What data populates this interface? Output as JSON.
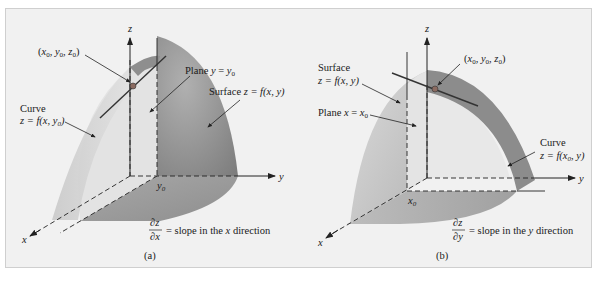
{
  "figure": {
    "panels": [
      {
        "id": "a",
        "caption": "(a)",
        "axes": {
          "x": "x",
          "y": "y",
          "z": "z"
        },
        "point_label": "(x0, y0, z0)",
        "point_label_parts": {
          "open": "(",
          "x": "x",
          "x_sub": "0",
          "y": "y",
          "y_sub": "0",
          "z": "z",
          "z_sub": "0",
          "close": ")"
        },
        "plane_label": {
          "prefix": "Plane ",
          "var": "y",
          "eq": " = ",
          "val": "y",
          "sub": "0"
        },
        "surface_label": {
          "prefix": "Surface ",
          "text": "z = f(x, y)"
        },
        "curve_label": {
          "title": "Curve",
          "text": "z = f(x, y",
          "sub": "0",
          "close": ")"
        },
        "axis_tick_label": {
          "var": "y",
          "sub": "0"
        },
        "derivative": {
          "num": "∂z",
          "den": "∂x",
          "text": "= slope in the ",
          "dir_var": "x",
          "suffix": " direction"
        }
      },
      {
        "id": "b",
        "caption": "(b)",
        "axes": {
          "x": "x",
          "y": "y",
          "z": "z"
        },
        "point_label": "(x0, y0, z0)",
        "point_label_parts": {
          "open": "(",
          "x": "x",
          "x_sub": "0",
          "y": "y",
          "y_sub": "0",
          "z": "z",
          "z_sub": "0",
          "close": ")"
        },
        "plane_label": {
          "prefix": "Plane ",
          "var": "x",
          "eq": " = ",
          "val": "x",
          "sub": "0"
        },
        "surface_label": {
          "title": "Surface",
          "text": "z = f(x, y)"
        },
        "curve_label": {
          "title": "Curve",
          "text": "z = f(x",
          "sub": "0",
          "close": ", y)"
        },
        "axis_tick_label": {
          "var": "x",
          "sub": "0"
        },
        "derivative": {
          "num": "∂z",
          "den": "∂y",
          "text": "= slope in the ",
          "dir_var": "y",
          "suffix": " direction"
        }
      }
    ],
    "colors": {
      "background": "#f1f1f1",
      "border": "#cfcfcf",
      "surface_dark": "#8a8a8a",
      "surface_light": "#d9d9d9",
      "curve_band": "#9a9a9a",
      "point": "#7a5a50",
      "line": "#222222"
    }
  }
}
